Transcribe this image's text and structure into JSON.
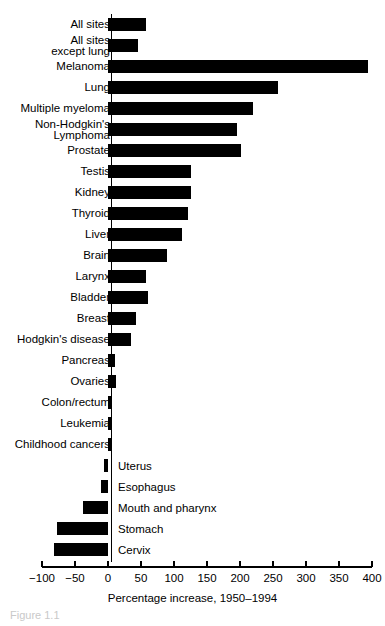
{
  "chart_data": {
    "type": "bar",
    "orientation": "horizontal",
    "title": "",
    "xlabel": "Percentage increase, 1950–1994",
    "ylabel": "",
    "xlim": [
      -100,
      400
    ],
    "xticks": [
      -100,
      -50,
      0,
      50,
      100,
      150,
      200,
      250,
      300,
      350,
      400
    ],
    "xtick_labels": [
      "−100",
      "−50",
      "0",
      "50",
      "100",
      "150",
      "200",
      "250",
      "300",
      "350",
      "400"
    ],
    "grid": false,
    "legend": null,
    "bar_color": "#000000",
    "categories": [
      "All sites",
      "All sites\nexcept lung",
      "Melanoma",
      "Lung",
      "Multiple myeloma",
      "Non-Hodgkin's\nLymphoma",
      "Prostate",
      "Testis",
      "Kidney",
      "Thyroid",
      "Liver",
      "Brain",
      "Larynx",
      "Bladder",
      "Breast",
      "Hodgkin's disease",
      "Pancreas",
      "Ovaries",
      "Colon/rectum",
      "Leukemia",
      "Childhood cancers",
      "Uterus",
      "Esophagus",
      "Mouth and pharynx",
      "Stomach",
      "Cervix"
    ],
    "values": [
      57,
      46,
      394,
      258,
      220,
      196,
      201,
      126,
      125,
      121,
      112,
      89,
      58,
      60,
      43,
      35,
      10,
      12,
      6,
      4,
      4,
      -6,
      -11,
      -38,
      -78,
      -82
    ]
  },
  "caption": {
    "figure_number": "Figure 1.1"
  }
}
